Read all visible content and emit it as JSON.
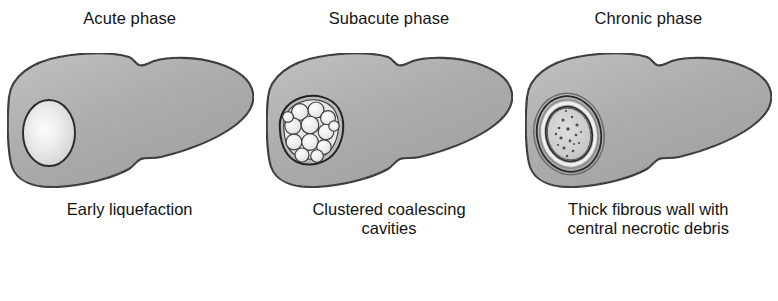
{
  "figure": {
    "panels": [
      {
        "title": "Acute phase",
        "caption": "Early liquefaction",
        "lesion_type": "solitary-liquefied-cavity",
        "lesion_description": "single pale oval cavity with thin dark rim"
      },
      {
        "title": "Subacute phase",
        "caption": "Clustered coalescing\ncavities",
        "lesion_type": "clustered-cavities",
        "lesion_description": "cluster of small pale coalescing bubbles within a dark rim"
      },
      {
        "title": "Chronic phase",
        "caption": "Thick fibrous wall with\ncentral necrotic debris",
        "lesion_type": "walled-abscess",
        "lesion_description": "thick concentric fibrous wall surrounding speckled necrotic debris"
      }
    ],
    "credit": ""
  },
  "colors": {
    "liver_fill": "#a9a9a9",
    "liver_fill_light": "#bdbdbd",
    "liver_outline": "#1e1e1e",
    "lesion_pale": "#ededed",
    "lesion_core": "#fafafa",
    "lesion_outline": "#2a2a2a",
    "debris": "#6e6e6e",
    "background": "#ffffff",
    "text": "#141414"
  }
}
